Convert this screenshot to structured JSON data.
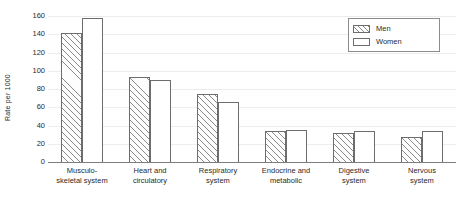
{
  "chart_data": {
    "type": "bar",
    "title": "",
    "xlabel": "",
    "ylabel": "Rate per 1000",
    "ylim": [
      0,
      160
    ],
    "yticks": [
      0,
      20,
      40,
      60,
      80,
      100,
      120,
      140,
      160
    ],
    "ytick_labels": [
      "0",
      "20",
      "40",
      "60",
      "80",
      "100",
      "120",
      "140",
      "160"
    ],
    "grid": true,
    "legend_position": "top-right",
    "categories": [
      "Musculo-skeletal system",
      "Heart and circulatory",
      "Respiratory system",
      "Endocrine and metabolic",
      "Digestive system",
      "Nervous system"
    ],
    "category_lines": [
      [
        "Musculo-",
        "skeletal system"
      ],
      [
        "Heart and",
        "circulatory"
      ],
      [
        "Respiratory",
        "system"
      ],
      [
        "Endocrine and",
        "metabolic"
      ],
      [
        "Digestive",
        "system"
      ],
      [
        "Nervous",
        "system"
      ]
    ],
    "series": [
      {
        "name": "Men",
        "values": [
          142,
          94,
          76,
          35,
          33,
          29
        ]
      },
      {
        "name": "Women",
        "values": [
          159,
          91,
          67,
          36,
          35,
          35
        ]
      }
    ]
  },
  "legend": {
    "items": [
      {
        "label": "Men",
        "pattern": "diagonal-hatch"
      },
      {
        "label": "Women",
        "pattern": "solid-white"
      }
    ]
  }
}
